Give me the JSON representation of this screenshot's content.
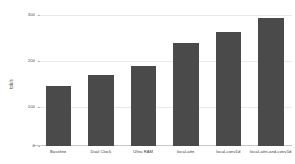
{
  "chart_data": {
    "type": "bar",
    "title": "",
    "xlabel": "",
    "ylabel": "tok/s",
    "categories": [
      "Baseline",
      "Dual Clock",
      "Ultra RAM",
      "local-attn",
      "local-conv1d",
      "local-attn-and-conv1d"
    ],
    "values": [
      138,
      164,
      185,
      238,
      264,
      296
    ],
    "ylim": [
      0,
      310
    ],
    "yticks": [
      0,
      100,
      200,
      300
    ],
    "ytick_labels": [
      "0",
      "100",
      "200",
      "300"
    ],
    "grid": true,
    "legend": "none",
    "bar_color": "#4a4a4a",
    "background_color": "#ffffff",
    "gridline_color": "#e9e9e9"
  }
}
